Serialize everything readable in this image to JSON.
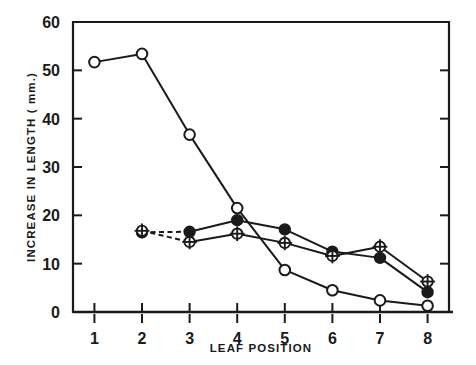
{
  "chart_data": {
    "type": "line",
    "title": "",
    "subtitle": "",
    "xlabel": "LEAF POSITION",
    "ylabel": "INCREASE IN LENGTH  ( mm.)",
    "x": [
      1,
      2,
      3,
      4,
      5,
      6,
      7,
      8
    ],
    "categories": [
      "1",
      "2",
      "3",
      "4",
      "5",
      "6",
      "7",
      "8"
    ],
    "xlim": [
      0.55,
      8.45
    ],
    "ylim": [
      0,
      60
    ],
    "xticks": [
      1,
      2,
      3,
      4,
      5,
      6,
      7,
      8
    ],
    "xtick_labels": [
      "1",
      "2",
      "3",
      "4",
      "5",
      "6",
      "7",
      "8"
    ],
    "yticks": [
      0,
      10,
      20,
      30,
      40,
      50,
      60
    ],
    "ytick_labels": [
      "0",
      "10",
      "20",
      "30",
      "40",
      "50",
      "60"
    ],
    "grid": false,
    "legend": false,
    "legend_position": "none",
    "annotations": [],
    "series": [
      {
        "name": "open-circle-series",
        "marker": "open-circle",
        "linestyle": "solid",
        "x": [
          1,
          2,
          3,
          4,
          5,
          6,
          7,
          8
        ],
        "values": [
          51.7,
          53.4,
          36.7,
          21.5,
          8.7,
          4.5,
          2.4,
          1.3
        ]
      },
      {
        "name": "filled-circle-series",
        "marker": "filled-circle",
        "linestyle": "dashed-then-solid",
        "dashed_segments": [
          [
            2,
            3
          ]
        ],
        "x": [
          2,
          3,
          4,
          5,
          6,
          7,
          8
        ],
        "values": [
          16.5,
          16.6,
          19.0,
          17.1,
          12.5,
          11.2,
          4.1
        ]
      },
      {
        "name": "crossed-circle-series",
        "marker": "crossed-circle",
        "linestyle": "dashed-then-solid",
        "dashed_segments": [
          [
            2,
            3
          ]
        ],
        "x": [
          2,
          3,
          4,
          5,
          6,
          7,
          8
        ],
        "values": [
          16.8,
          14.5,
          16.2,
          14.3,
          11.6,
          13.5,
          6.3
        ]
      }
    ],
    "colors": {
      "axis": "#1a1a1a",
      "line": "#1a1a1a",
      "marker_fill_open": "#ffffff",
      "marker_fill_closed": "#1a1a1a",
      "background": "#ffffff"
    }
  }
}
